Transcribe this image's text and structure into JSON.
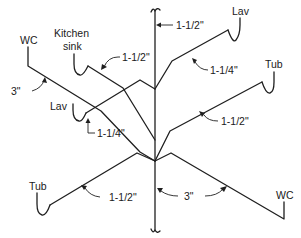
{
  "diagram": {
    "type": "isometric plumbing drainage riser diagram",
    "fixtures": {
      "wc_left": "WC",
      "kitchen_sink_line1": "Kitchen",
      "kitchen_sink_line2": "sink",
      "lav_top_right": "Lav",
      "lav_left": "Lav",
      "tub_right": "Tub",
      "tub_left": "Tub",
      "wc_right": "WC"
    },
    "pipe_sizes": {
      "stack": "1-1/2\"",
      "kitchen_sink": "1-1/2\"",
      "lav_top_right": "1-1/4\"",
      "wc_left": "3\"",
      "lav_left": "1-1/4\"",
      "tub_right": "1-1/2\"",
      "tub_left": "1-1/2\"",
      "wc_right": "3\""
    },
    "colors": {
      "line": "#1f1f1f",
      "background": "#ffffff"
    }
  }
}
